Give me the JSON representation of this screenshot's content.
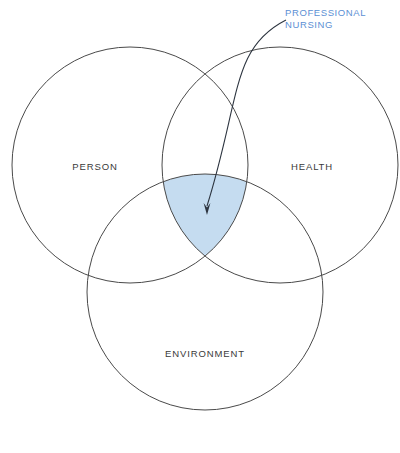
{
  "diagram": {
    "type": "venn",
    "background_color": "#ffffff",
    "stroke_color": "#4a4a4a",
    "highlight_color": "#c5dcf0",
    "callout_color": "#5b8fd4",
    "label_color": "#3a3a3a",
    "circles": [
      {
        "id": "person",
        "label": "PERSON",
        "cx": 130,
        "cy": 165,
        "r": 118,
        "label_x": 95,
        "label_y": 167
      },
      {
        "id": "health",
        "label": "HEALTH",
        "cx": 280,
        "cy": 165,
        "r": 118,
        "label_x": 312,
        "label_y": 167
      },
      {
        "id": "environment",
        "label": "ENVIRONMENT",
        "cx": 205,
        "cy": 292,
        "r": 118,
        "label_x": 205,
        "label_y": 354
      }
    ],
    "intersection": {
      "id": "triple-intersection",
      "name": "professional-nursing-region",
      "fill": "#c5dcf0"
    },
    "callout": {
      "line1": "PROFESSIONAL",
      "line2": "NURSING",
      "text_x": 285,
      "text_y1": 13,
      "text_y2": 25,
      "arrow_start_x": 286,
      "arrow_start_y": 20,
      "arrow_tip_x": 207,
      "arrow_tip_y": 215
    }
  }
}
